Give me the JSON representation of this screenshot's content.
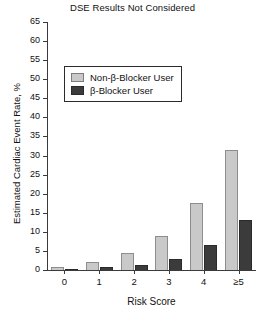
{
  "chart_data": {
    "type": "bar",
    "title": "DSE Results Not Considered",
    "xlabel": "Risk Score",
    "ylabel": "Estimated Cardiac Event Rate, %",
    "categories": [
      "0",
      "1",
      "2",
      "3",
      "4",
      "≥5"
    ],
    "yticks": [
      0,
      5,
      10,
      15,
      20,
      25,
      30,
      35,
      40,
      45,
      50,
      55,
      60,
      65
    ],
    "ylim": [
      0,
      65
    ],
    "grid": false,
    "legend_position": "upper-left",
    "series": [
      {
        "name": "Non-β-Blocker User",
        "color": "#c9c9c9",
        "values": [
          0.7,
          2.2,
          4.5,
          9.0,
          17.5,
          31.5
        ]
      },
      {
        "name": "β-Blocker User",
        "color": "#3b3b3b",
        "values": [
          0.2,
          0.8,
          1.3,
          2.8,
          6.5,
          13.0
        ]
      }
    ]
  }
}
